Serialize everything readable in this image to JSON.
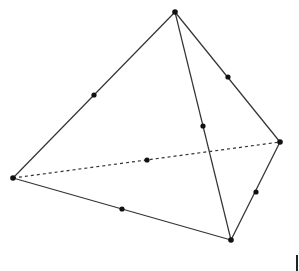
{
  "figure": {
    "type": "tetrahedron-wireframe",
    "vertices": {
      "A": [
        175,
        12
      ],
      "B": [
        13,
        178
      ],
      "C": [
        231,
        240
      ],
      "D": [
        280,
        142
      ]
    },
    "edges": [
      {
        "from": "A",
        "to": "B",
        "style": "solid"
      },
      {
        "from": "A",
        "to": "C",
        "style": "solid"
      },
      {
        "from": "A",
        "to": "D",
        "style": "solid"
      },
      {
        "from": "B",
        "to": "C",
        "style": "solid"
      },
      {
        "from": "C",
        "to": "D",
        "style": "solid"
      },
      {
        "from": "B",
        "to": "D",
        "style": "dashed"
      }
    ],
    "midpoints": [
      {
        "edge": "AB",
        "pos": [
          94,
          95
        ]
      },
      {
        "edge": "AC",
        "pos": [
          203,
          126
        ]
      },
      {
        "edge": "AD",
        "pos": [
          228,
          77
        ]
      },
      {
        "edge": "BC",
        "pos": [
          122,
          209
        ]
      },
      {
        "edge": "CD",
        "pos": [
          256,
          192
        ]
      },
      {
        "edge": "BD",
        "pos": [
          147,
          160
        ]
      }
    ],
    "colors": {
      "line": "#333333",
      "point": "#111111",
      "background": "#ffffff"
    }
  }
}
